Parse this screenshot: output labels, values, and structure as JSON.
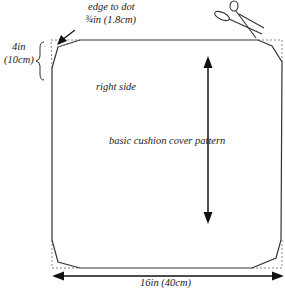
{
  "diagram": {
    "title": "basic cushion cover pattern",
    "labels": {
      "edge_to_dot_line1": "edge to dot",
      "edge_to_dot_line2": "¾in (1.8cm)",
      "corner_height_line1": "4in",
      "corner_height_line2": "(10cm)",
      "right_side": "right side",
      "pattern_name": "basic cushion cover pattern",
      "width": "16in (40cm)"
    },
    "icons": [
      "scissors-icon",
      "arrow-icon"
    ],
    "colors": {
      "line": "#333333",
      "dotted": "#888888",
      "text": "#222222"
    }
  }
}
